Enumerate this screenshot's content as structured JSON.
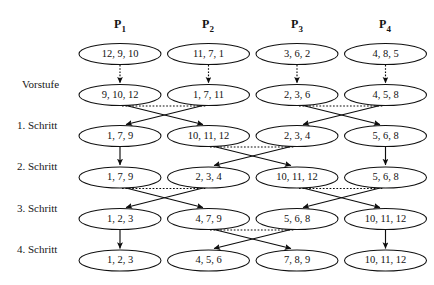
{
  "figure": {
    "type": "sorting-network-diagram",
    "columns": [
      {
        "label": "P",
        "sub": "1"
      },
      {
        "label": "P",
        "sub": "2"
      },
      {
        "label": "P",
        "sub": "3"
      },
      {
        "label": "P",
        "sub": "4"
      }
    ],
    "step_labels": [
      "Vorstufe",
      "1. Schritt",
      "2. Schritt",
      "3. Schritt",
      "4. Schritt"
    ],
    "rows": [
      {
        "id": "row0",
        "nodes": [
          "12, 9, 10",
          "11, 7, 1",
          "3, 6, 2",
          "4, 8, 5"
        ]
      },
      {
        "id": "row1",
        "nodes": [
          "9, 10, 12",
          "1, 7, 11",
          "2, 3, 6",
          "4, 5, 8"
        ]
      },
      {
        "id": "row2",
        "nodes": [
          "1, 7, 9",
          "10, 11, 12",
          "2, 3, 4",
          "5, 6, 8"
        ]
      },
      {
        "id": "row3",
        "nodes": [
          "1, 7, 9",
          "2, 3, 4",
          "10, 11, 12",
          "5, 6, 8"
        ]
      },
      {
        "id": "row4",
        "nodes": [
          "1, 2, 3",
          "4, 7, 9",
          "5, 6, 8",
          "10, 11, 12"
        ]
      },
      {
        "id": "row5",
        "nodes": [
          "1, 2, 3",
          "4, 5, 6",
          "7, 8, 9",
          "10, 11, 12"
        ]
      }
    ],
    "colors": {
      "stroke": "#0d0d0d",
      "node_fill": "#ffffff",
      "text": "#121212",
      "background": "#ffffff"
    },
    "layout": {
      "column_centers": [
        120,
        208.5,
        297,
        385.5
      ],
      "row_centers": [
        54,
        95,
        136,
        177.5,
        219,
        260.5
      ],
      "ellipse_rx": 41,
      "ellipse_ry": 10.5
    },
    "edges": {
      "vorstufe": {
        "style": "dotted-vertical",
        "pairs": "each column straight down"
      },
      "schritt1": {
        "style": "cross",
        "pairs": [
          [
            1,
            2
          ],
          [
            3,
            4
          ]
        ]
      },
      "schritt2": {
        "style": "cross-middle",
        "pairs": [
          [
            2,
            3
          ]
        ],
        "straight": [
          1,
          4
        ]
      },
      "schritt3": {
        "style": "cross",
        "pairs": [
          [
            1,
            2
          ],
          [
            3,
            4
          ]
        ]
      },
      "schritt4": {
        "style": "cross-middle",
        "pairs": [
          [
            2,
            3
          ]
        ],
        "straight": [
          1,
          4
        ]
      }
    }
  }
}
